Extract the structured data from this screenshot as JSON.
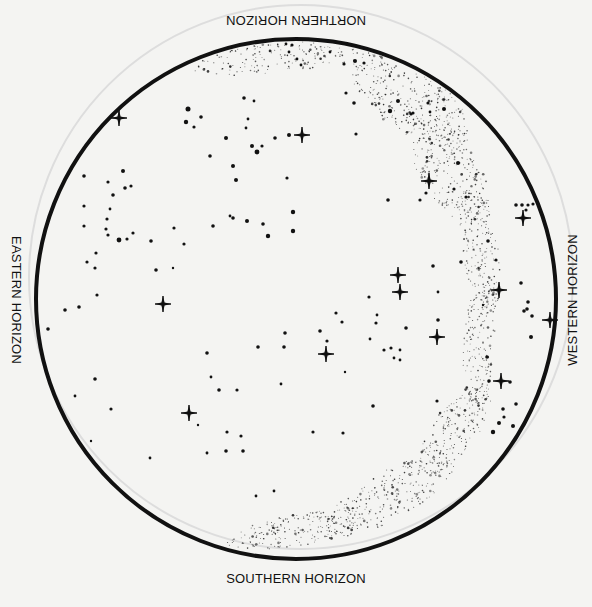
{
  "chart": {
    "center": [
      296,
      299
    ],
    "radius": 260,
    "stroke_color": "#111111",
    "stroke_width": 4,
    "background": "#f4f4f2",
    "faint_ring_color": "#dddddd"
  },
  "labels": {
    "north": "NORTHERN HORIZON",
    "south": "SOUTHERN HORIZON",
    "east": "EASTERN HORIZON",
    "west": "WESTERN HORIZON"
  },
  "bright_stars": [
    [
      119,
      118
    ],
    [
      302,
      135
    ],
    [
      429,
      181
    ],
    [
      523,
      218
    ],
    [
      398,
      275
    ],
    [
      400,
      292
    ],
    [
      163,
      304
    ],
    [
      499,
      290
    ],
    [
      550,
      320
    ],
    [
      437,
      337
    ],
    [
      326,
      354
    ],
    [
      501,
      381
    ],
    [
      189,
      413
    ]
  ],
  "stars": [
    [
      188,
      109,
      2.5
    ],
    [
      201,
      117,
      1.8
    ],
    [
      186,
      122,
      2.2
    ],
    [
      194,
      127,
      1.6
    ],
    [
      244,
      98,
      1.8
    ],
    [
      254,
      101,
      1.4
    ],
    [
      248,
      119,
      1.4
    ],
    [
      246,
      128,
      1.4
    ],
    [
      226,
      138,
      2
    ],
    [
      252,
      146,
      2
    ],
    [
      275,
      138,
      1.8
    ],
    [
      289,
      135,
      2
    ],
    [
      262,
      146,
      1.6
    ],
    [
      257,
      152,
      2.4
    ],
    [
      210,
      156,
      1.8
    ],
    [
      233,
      166,
      2
    ],
    [
      287,
      178,
      1.6
    ],
    [
      236,
      180,
      2
    ],
    [
      123,
      171,
      2
    ],
    [
      108,
      182,
      1.6
    ],
    [
      125,
      188,
      1.8
    ],
    [
      131,
      186,
      1.6
    ],
    [
      113,
      195,
      1.8
    ],
    [
      110,
      209,
      1.4
    ],
    [
      84,
      176,
      1.8
    ],
    [
      84,
      206,
      1.6
    ],
    [
      84,
      226,
      1.6
    ],
    [
      107,
      219,
      1.6
    ],
    [
      106,
      229,
      1.6
    ],
    [
      108,
      235,
      1.6
    ],
    [
      119,
      240,
      2.4
    ],
    [
      127,
      239,
      1.6
    ],
    [
      133,
      233,
      1.6
    ],
    [
      151,
      241,
      1.8
    ],
    [
      174,
      228,
      1.6
    ],
    [
      184,
      244,
      1.6
    ],
    [
      213,
      226,
      1.8
    ],
    [
      230,
      216,
      1.4
    ],
    [
      233,
      218,
      1.8
    ],
    [
      247,
      221,
      2
    ],
    [
      263,
      224,
      1.8
    ],
    [
      268,
      236,
      2.2
    ],
    [
      293,
      212,
      2.2
    ],
    [
      293,
      231,
      2.2
    ],
    [
      96,
      253,
      1.6
    ],
    [
      87,
      262,
      1.6
    ],
    [
      95,
      268,
      1.6
    ],
    [
      156,
      270,
      1.8
    ],
    [
      173,
      268,
      1.2
    ],
    [
      97,
      295,
      1.6
    ],
    [
      79,
      307,
      1.8
    ],
    [
      65,
      310,
      1.8
    ],
    [
      48,
      329,
      1.8
    ],
    [
      95,
      379,
      1.8
    ],
    [
      75,
      396,
      1.4
    ],
    [
      111,
      409,
      1.6
    ],
    [
      91,
      441,
      1.2
    ],
    [
      150,
      458,
      1.4
    ],
    [
      207,
      353,
      1.8
    ],
    [
      211,
      377,
      1.4
    ],
    [
      219,
      390,
      1.8
    ],
    [
      237,
      390,
      1.6
    ],
    [
      227,
      432,
      1.6
    ],
    [
      241,
      436,
      1.6
    ],
    [
      226,
      451,
      1.8
    ],
    [
      243,
      451,
      1.8
    ],
    [
      207,
      453,
      1.4
    ],
    [
      207,
      453,
      1.2
    ],
    [
      198,
      425,
      1.2
    ],
    [
      258,
      347,
      1.8
    ],
    [
      285,
      333,
      1.8
    ],
    [
      284,
      347,
      1.8
    ],
    [
      281,
      384,
      1.4
    ],
    [
      345,
      372,
      1.2
    ],
    [
      313,
      432,
      1.6
    ],
    [
      343,
      433,
      1.6
    ],
    [
      256,
      496,
      1.4
    ],
    [
      274,
      491,
      1.4
    ],
    [
      336,
      313,
      1.6
    ],
    [
      342,
      322,
      1.6
    ],
    [
      320,
      331,
      1.8
    ],
    [
      327,
      341,
      1.6
    ],
    [
      369,
      297,
      1.6
    ],
    [
      377,
      315,
      1.4
    ],
    [
      376,
      323,
      1.6
    ],
    [
      370,
      339,
      1.4
    ],
    [
      384,
      350,
      1.6
    ],
    [
      391,
      348,
      1.6
    ],
    [
      400,
      350,
      1.4
    ],
    [
      394,
      358,
      1.4
    ],
    [
      400,
      360,
      1.4
    ],
    [
      406,
      328,
      1.8
    ],
    [
      438,
      320,
      1.8
    ],
    [
      373,
      406,
      1.8
    ],
    [
      433,
      266,
      1.8
    ],
    [
      438,
      292,
      1.4
    ],
    [
      426,
      193,
      1.6
    ],
    [
      420,
      200,
      1.6
    ],
    [
      437,
      401,
      1.6
    ],
    [
      521,
      283,
      1.8
    ],
    [
      528,
      302,
      1.8
    ],
    [
      527,
      309,
      1.8
    ],
    [
      524,
      311,
      1.8
    ],
    [
      532,
      316,
      1.8
    ],
    [
      531,
      337,
      2
    ],
    [
      510,
      382,
      1.8
    ],
    [
      516,
      404,
      1.8
    ],
    [
      503,
      409,
      1.8
    ],
    [
      504,
      417,
      1.6
    ],
    [
      499,
      423,
      2
    ],
    [
      513,
      426,
      2
    ],
    [
      493,
      432,
      2.2
    ],
    [
      516,
      205,
      1.8
    ],
    [
      522,
      205,
      1.8
    ],
    [
      528,
      205,
      1.6
    ],
    [
      533,
      204,
      1.6
    ],
    [
      526,
      210,
      1.6
    ],
    [
      388,
      200,
      1.8
    ],
    [
      356,
      134,
      1.6
    ],
    [
      354,
      103,
      1.8
    ],
    [
      346,
      93,
      1.6
    ],
    [
      458,
      163,
      2
    ],
    [
      454,
      189,
      1.6
    ],
    [
      466,
      197,
      1.6
    ],
    [
      488,
      241,
      1.8
    ],
    [
      461,
      262,
      1.8
    ],
    [
      496,
      260,
      1.6
    ],
    [
      489,
      381,
      1.8
    ],
    [
      483,
      305,
      1.2
    ],
    [
      487,
      357,
      1.8
    ],
    [
      413,
      113,
      1.6
    ],
    [
      355,
      61,
      2
    ],
    [
      364,
      63,
      1.6
    ],
    [
      344,
      64,
      1.6
    ],
    [
      330,
      52,
      1.4
    ],
    [
      301,
      65,
      1.4
    ],
    [
      289,
      52,
      1.4
    ],
    [
      286,
      44,
      1.4
    ],
    [
      292,
      45,
      1.6
    ],
    [
      297,
      59,
      1.4
    ],
    [
      390,
      111,
      2.2
    ],
    [
      398,
      101,
      2
    ],
    [
      428,
      103,
      1.6
    ],
    [
      444,
      109,
      2
    ],
    [
      411,
      114,
      1.6
    ],
    [
      430,
      112,
      1.4
    ]
  ],
  "milky_way": {
    "dot_color": "#222222",
    "seed": 7,
    "bands": [
      {
        "cx": 300,
        "cy": 52,
        "rx": 110,
        "ry": 18,
        "rot": -8,
        "count": 260
      },
      {
        "cx": 410,
        "cy": 100,
        "rx": 70,
        "ry": 32,
        "rot": 35,
        "count": 320
      },
      {
        "cx": 450,
        "cy": 170,
        "rx": 60,
        "ry": 30,
        "rot": 60,
        "count": 240
      },
      {
        "cx": 480,
        "cy": 250,
        "rx": 65,
        "ry": 18,
        "rot": 82,
        "count": 180
      },
      {
        "cx": 480,
        "cy": 340,
        "rx": 65,
        "ry": 16,
        "rot": 95,
        "count": 170
      },
      {
        "cx": 455,
        "cy": 430,
        "rx": 55,
        "ry": 22,
        "rot": 125,
        "count": 200
      },
      {
        "cx": 390,
        "cy": 495,
        "rx": 75,
        "ry": 24,
        "rot": 150,
        "count": 240
      },
      {
        "cx": 300,
        "cy": 530,
        "rx": 75,
        "ry": 16,
        "rot": 170,
        "count": 200
      }
    ]
  }
}
